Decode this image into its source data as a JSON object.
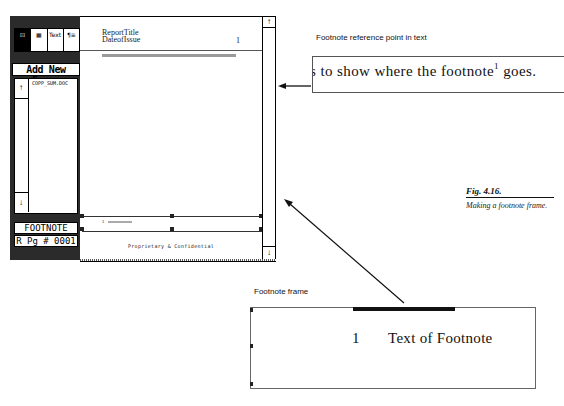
{
  "app": {
    "toolbox": {
      "tools": [
        {
          "name": "frame-tool",
          "icon": "⊡",
          "active": true
        },
        {
          "name": "graphics-tool",
          "icon": "▦",
          "active": false
        },
        {
          "name": "text-tool",
          "icon": "Text",
          "active": false
        },
        {
          "name": "paragraph-tool",
          "icon": "¶≡",
          "active": false
        }
      ]
    },
    "sidebar": {
      "add_frame_label": "Add New Frame",
      "file_list": [
        "COPP_SUM.DOC"
      ],
      "scroll_up": "↑",
      "scroll_down": "↓",
      "selected_frame": "FOOTNOTE",
      "page_indicator": "R Pg # 0001"
    },
    "document": {
      "header": {
        "title": "ReportTitle",
        "date": "DateofIssue",
        "page_number": "1"
      },
      "footnote_small_num": "1",
      "footer": "Proprietary & Confidential",
      "scroll_up": "↑",
      "scroll_down": "↓"
    }
  },
  "callouts": {
    "reference_caption": "Footnote reference point in text",
    "reference_text_before": "s to show where the footnote",
    "reference_superscript": "1",
    "reference_text_after": " goes.",
    "footnote_caption": "Footnote frame",
    "footnote_number": "1",
    "footnote_text": "Text of Footnote"
  },
  "figure": {
    "label": "Fig. 4.16.",
    "caption": "Making a footnote frame."
  }
}
